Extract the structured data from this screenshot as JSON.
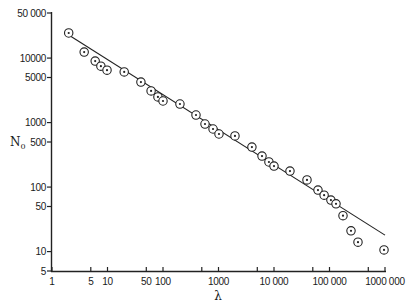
{
  "chart_data": {
    "type": "scatter",
    "title": "",
    "xlabel": "λ",
    "ylabel": "N0",
    "ylabel_main": "N",
    "ylabel_sub": "0",
    "xscale": "log",
    "yscale": "log",
    "xlim": [
      1,
      1000000
    ],
    "ylim": [
      5,
      50000
    ],
    "grid": false,
    "legend": null,
    "x_ticks": [
      {
        "value": 1,
        "label": "1"
      },
      {
        "value": 5,
        "label": "5"
      },
      {
        "value": 10,
        "label": "10"
      },
      {
        "value": 50,
        "label": "50"
      },
      {
        "value": 100,
        "label": "100"
      },
      {
        "value": 500,
        "label": ""
      },
      {
        "value": 1000,
        "label": "1000"
      },
      {
        "value": 5000,
        "label": ""
      },
      {
        "value": 10000,
        "label": "10 000"
      },
      {
        "value": 50000,
        "label": ""
      },
      {
        "value": 100000,
        "label": "100 000"
      },
      {
        "value": 500000,
        "label": ""
      },
      {
        "value": 1000000,
        "label": "1000 000"
      }
    ],
    "y_ticks": [
      {
        "value": 5,
        "label": "5"
      },
      {
        "value": 10,
        "label": "10"
      },
      {
        "value": 50,
        "label": "50"
      },
      {
        "value": 100,
        "label": "100"
      },
      {
        "value": 500,
        "label": "500"
      },
      {
        "value": 1000,
        "label": "1000"
      },
      {
        "value": 5000,
        "label": "5000"
      },
      {
        "value": 10000,
        "label": "10000"
      },
      {
        "value": 50000,
        "label": "50 000"
      }
    ],
    "series": [
      {
        "name": "observed",
        "marker": "circle-dot",
        "points": [
          {
            "x": 2,
            "y": 24500
          },
          {
            "x": 3.8,
            "y": 12400
          },
          {
            "x": 6,
            "y": 9000
          },
          {
            "x": 7.6,
            "y": 7500
          },
          {
            "x": 9.8,
            "y": 6500
          },
          {
            "x": 20,
            "y": 6100
          },
          {
            "x": 40,
            "y": 4250
          },
          {
            "x": 61,
            "y": 3100
          },
          {
            "x": 81,
            "y": 2500
          },
          {
            "x": 100,
            "y": 2160
          },
          {
            "x": 202,
            "y": 1940
          },
          {
            "x": 393,
            "y": 1310
          },
          {
            "x": 571,
            "y": 950
          },
          {
            "x": 797,
            "y": 795
          },
          {
            "x": 1020,
            "y": 665
          },
          {
            "x": 1980,
            "y": 620
          },
          {
            "x": 4000,
            "y": 417
          },
          {
            "x": 6080,
            "y": 303
          },
          {
            "x": 8100,
            "y": 245
          },
          {
            "x": 10000,
            "y": 212
          },
          {
            "x": 19400,
            "y": 177
          },
          {
            "x": 39300,
            "y": 129
          },
          {
            "x": 62000,
            "y": 90
          },
          {
            "x": 80000,
            "y": 75
          },
          {
            "x": 106000,
            "y": 63
          },
          {
            "x": 131000,
            "y": 55
          },
          {
            "x": 175000,
            "y": 36
          },
          {
            "x": 244000,
            "y": 21
          },
          {
            "x": 326000,
            "y": 14
          },
          {
            "x": 960000,
            "y": 10.6
          }
        ]
      }
    ],
    "fit_line": {
      "name": "power-law fit",
      "start": {
        "x": 2,
        "y": 22800
      },
      "end": {
        "x": 1000000,
        "y": 18
      }
    }
  }
}
